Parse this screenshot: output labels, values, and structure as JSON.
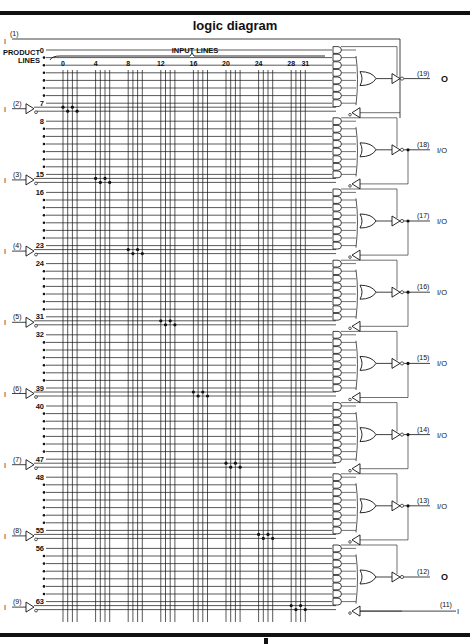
{
  "title": "logic diagram",
  "header": {
    "product_lines_label": [
      "PRODUCT",
      "LINES"
    ],
    "input_lines_label": "INPUT LINES",
    "input_column_ticks": [
      "0",
      "4",
      "8",
      "12",
      "16",
      "20",
      "24",
      "28",
      "31"
    ],
    "input_column_count": 32
  },
  "product_lines": {
    "count": 64,
    "group_labels": [
      {
        "start": "0",
        "end": "7"
      },
      {
        "start": "8",
        "end": "15"
      },
      {
        "start": "16",
        "end": "23"
      },
      {
        "start": "24",
        "end": "31"
      },
      {
        "start": "32",
        "end": "39"
      },
      {
        "start": "40",
        "end": "47"
      },
      {
        "start": "48",
        "end": "55"
      },
      {
        "start": "56",
        "end": "63"
      }
    ]
  },
  "inputs": [
    {
      "pin": "(1)",
      "type": "I"
    },
    {
      "pin": "(2)",
      "type": "I"
    },
    {
      "pin": "(3)",
      "type": "I"
    },
    {
      "pin": "(4)",
      "type": "I"
    },
    {
      "pin": "(5)",
      "type": "I"
    },
    {
      "pin": "(6)",
      "type": "I"
    },
    {
      "pin": "(7)",
      "type": "I"
    },
    {
      "pin": "(8)",
      "type": "I"
    },
    {
      "pin": "(9)",
      "type": "I"
    }
  ],
  "outputs": [
    {
      "pin": "(19)",
      "type": "O"
    },
    {
      "pin": "(18)",
      "type": "I/O"
    },
    {
      "pin": "(17)",
      "type": "I/O"
    },
    {
      "pin": "(16)",
      "type": "I/O"
    },
    {
      "pin": "(15)",
      "type": "I/O"
    },
    {
      "pin": "(14)",
      "type": "I/O"
    },
    {
      "pin": "(13)",
      "type": "I/O"
    },
    {
      "pin": "(12)",
      "type": "O"
    }
  ],
  "bottom_input": {
    "pin": "(11)",
    "type": "I"
  },
  "colors": {
    "ink": "#111111",
    "paper": "#ffffff"
  }
}
